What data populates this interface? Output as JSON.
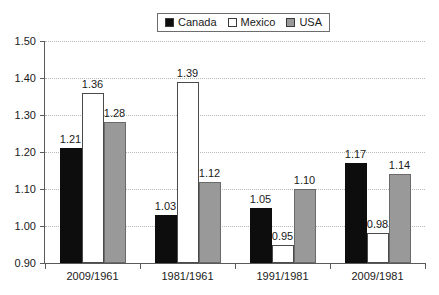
{
  "chart_data": {
    "type": "bar",
    "title": "",
    "xlabel": "",
    "ylabel": "",
    "ylim": [
      0.9,
      1.5
    ],
    "ytick_step": 0.1,
    "grid": true,
    "legend_position": "top-center",
    "categories": [
      "2009/1961",
      "1981/1961",
      "1991/1981",
      "2009/1981"
    ],
    "ytick_labels": [
      "1.50",
      "1.40",
      "1.30",
      "1.20",
      "1.10",
      "1.00",
      "0.90"
    ],
    "ytick_values": [
      1.5,
      1.4,
      1.3,
      1.2,
      1.1,
      1.0,
      0.9
    ],
    "series": [
      {
        "name": "Canada",
        "color": "#0d0d0d",
        "values": [
          1.21,
          1.03,
          1.05,
          1.17
        ],
        "labels": [
          "1.21",
          "1.03",
          "1.05",
          "1.17"
        ]
      },
      {
        "name": "Mexico",
        "color": "#ffffff",
        "values": [
          1.36,
          1.39,
          0.95,
          0.98
        ],
        "labels": [
          "1.36",
          "1.39",
          "0.95",
          "0.98"
        ]
      },
      {
        "name": "USA",
        "color": "#999999",
        "values": [
          1.28,
          1.12,
          1.1,
          1.14
        ],
        "labels": [
          "1.28",
          "1.12",
          "1.10",
          "1.14"
        ]
      }
    ]
  },
  "legend": {
    "entries": [
      {
        "label": "Canada",
        "swatch": "#0d0d0d"
      },
      {
        "label": "Mexico",
        "swatch": "#ffffff"
      },
      {
        "label": "USA",
        "swatch": "#999999"
      }
    ]
  }
}
